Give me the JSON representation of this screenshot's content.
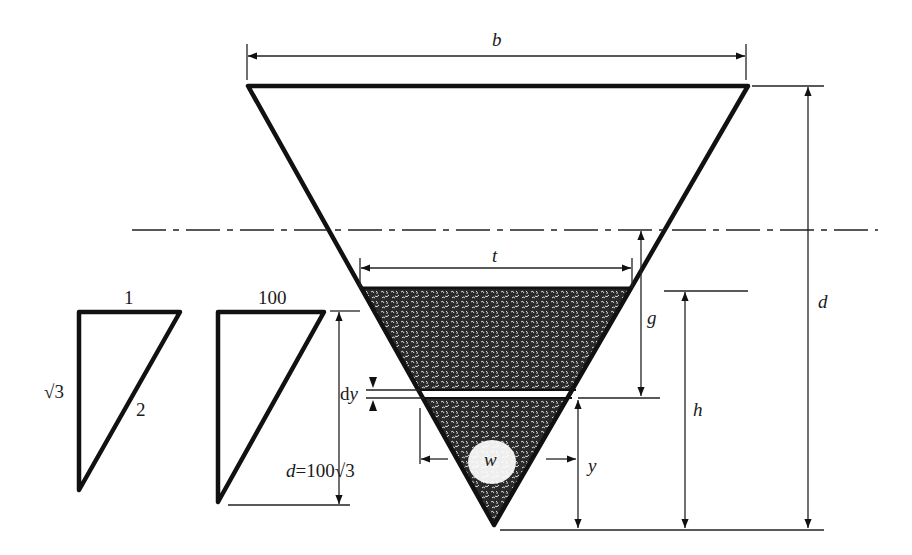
{
  "diagram": {
    "labels": {
      "top_width": "b",
      "total_depth": "d",
      "fill_top_width": "t",
      "gap_depth": "g",
      "fill_height": "h",
      "strip_thickness": "dy",
      "strip_height": "y",
      "strip_width": "w"
    },
    "small_triangle": {
      "top": "1",
      "hypotenuse": "2",
      "side": "√3"
    },
    "scaled_triangle": {
      "top": "100",
      "depth_label_var": "d",
      "depth_label_eq": "=100",
      "depth_label_root": "√3"
    },
    "colors": {
      "ink": "#111111",
      "fill": "#2b2b2b",
      "background": "#ffffff"
    }
  }
}
